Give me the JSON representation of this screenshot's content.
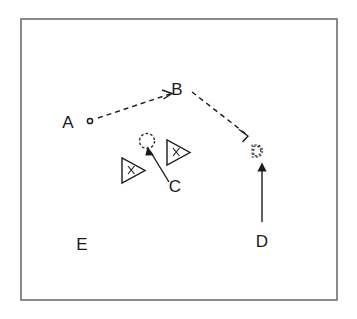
{
  "figure": {
    "title": "",
    "background_color": "#ffffff",
    "frame_color": "#6e6e6e",
    "ink_color": "#1a1a1a",
    "width": 357,
    "height": 319
  },
  "labels": {
    "a": "A",
    "b": "B",
    "c_target": "C",
    "c_source": "C",
    "d_target": "D",
    "d_source": "D",
    "e": "E"
  },
  "nodes": [
    {
      "id": "A",
      "label": "A",
      "marker": "small-circle",
      "style": "solid",
      "x": 88,
      "y": 121
    },
    {
      "id": "B",
      "label": "B",
      "marker": "text",
      "style": "solid",
      "x": 176,
      "y": 88
    },
    {
      "id": "C",
      "label": "C",
      "marker": "dashed-circle",
      "style": "dashed",
      "x": 146,
      "y": 141
    },
    {
      "id": "D",
      "label": "D",
      "marker": "dashed-text",
      "style": "dashed",
      "x": 257,
      "y": 150
    },
    {
      "id": "E",
      "label": "E",
      "marker": "text",
      "style": "solid",
      "x": 82,
      "y": 243
    }
  ],
  "agents": [
    {
      "id": "agent-left",
      "shape": "triangle-right",
      "mark": "x",
      "x": 133,
      "y": 170
    },
    {
      "id": "agent-right",
      "shape": "triangle-right",
      "mark": "x",
      "x": 178,
      "y": 152
    }
  ],
  "edges": [
    {
      "id": "a-to-b",
      "from": "A",
      "to": "B",
      "style": "dashed",
      "arrow": "open"
    },
    {
      "id": "b-to-d",
      "from": "B",
      "to": "D",
      "style": "dashed",
      "arrow": "open"
    },
    {
      "id": "c-label-to-c",
      "from": "C-label",
      "to": "C",
      "style": "solid",
      "arrow": "filled"
    },
    {
      "id": "d-label-to-d",
      "from": "D-label",
      "to": "D",
      "style": "solid",
      "arrow": "filled"
    }
  ]
}
